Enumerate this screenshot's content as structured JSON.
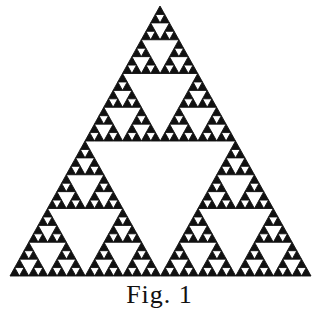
{
  "figure": {
    "kind": "sierpinski-triangle",
    "depth": 5,
    "apex": [
      160,
      6
    ],
    "base_left": [
      10,
      276
    ],
    "base_right": [
      311,
      276
    ],
    "fill_color": "#111111",
    "hole_color": "#ffffff",
    "background": "#ffffff"
  },
  "caption": {
    "text": "Fig. 1"
  }
}
